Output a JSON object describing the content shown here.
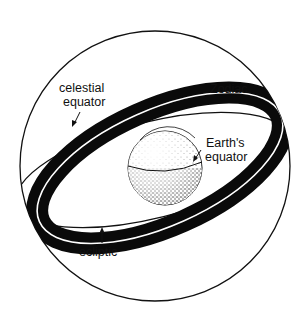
{
  "diagram": {
    "type": "celestial-sphere",
    "colors": {
      "background": "#ffffff",
      "ink": "#111111",
      "band": "#0a0a0a"
    },
    "labels": {
      "celestial_equator_line1": "celestial",
      "celestial_equator_line2": "equator",
      "zodiac": "Zodiac",
      "earths_equator_line1": "Earth's",
      "earths_equator_line2": "equator",
      "ecliptic": "ecliptic"
    },
    "elements": [
      {
        "name": "celestial-sphere",
        "shape": "circle"
      },
      {
        "name": "zodiac-band",
        "shape": "tilted ellipse band, black, with white ecliptic line at center"
      },
      {
        "name": "celestial-equator-ring",
        "shape": "thin tilted ellipse"
      },
      {
        "name": "earth",
        "shape": "stippled sphere with equator line"
      }
    ]
  }
}
